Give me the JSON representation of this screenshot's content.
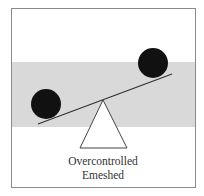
{
  "figure": {
    "caption_line1": "Overcontrolled",
    "caption_line2": "Emeshed"
  },
  "colors": {
    "frame": "#8a8a8a",
    "band": "#d9d9d9",
    "ball": "#111111",
    "beam": "#333333",
    "fulcrum_stroke": "#444444"
  }
}
